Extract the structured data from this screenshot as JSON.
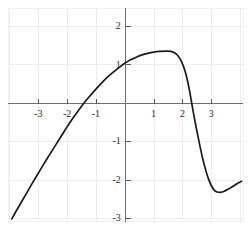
{
  "chart_data": {
    "type": "line",
    "title": "",
    "subtitle": "",
    "xlabel": "",
    "ylabel": "",
    "xlim": [
      -4.05,
      4.1
    ],
    "ylim": [
      -3.1,
      2.47
    ],
    "grid": true,
    "grid_spacing": {
      "x": 1,
      "y": 1
    },
    "legend": "none",
    "axis_origin": {
      "x": 0,
      "y": 0
    },
    "xticks": [
      -3,
      -2,
      -1,
      1,
      2,
      3
    ],
    "yticks": [
      2,
      1,
      -1,
      -2,
      -3
    ],
    "xtick_labels": [
      "-3",
      "-2",
      "-1",
      "1",
      "2",
      "3"
    ],
    "ytick_labels": [
      "2",
      "1",
      "-1",
      "-2",
      "-3"
    ],
    "series": [
      {
        "name": "curve",
        "color": "#1a1a1a",
        "points": [
          [
            -3.92,
            -3.02
          ],
          [
            -3.8,
            -2.86
          ],
          [
            -3.6,
            -2.6
          ],
          [
            -3.4,
            -2.34
          ],
          [
            -3.2,
            -2.08
          ],
          [
            -3.0,
            -1.83
          ],
          [
            -2.8,
            -1.58
          ],
          [
            -2.6,
            -1.34
          ],
          [
            -2.4,
            -1.1
          ],
          [
            -2.2,
            -0.86
          ],
          [
            -2.05,
            -0.68
          ],
          [
            -2.0,
            -0.62
          ],
          [
            -1.8,
            -0.4
          ],
          [
            -1.6,
            -0.19
          ],
          [
            -1.4,
            0.01
          ],
          [
            -1.2,
            0.19
          ],
          [
            -1.0,
            0.36
          ],
          [
            -0.8,
            0.52
          ],
          [
            -0.6,
            0.67
          ],
          [
            -0.4,
            0.8
          ],
          [
            -0.2,
            0.92
          ],
          [
            0.0,
            1.03
          ],
          [
            0.2,
            1.12
          ],
          [
            0.4,
            1.19
          ],
          [
            0.6,
            1.25
          ],
          [
            0.8,
            1.29
          ],
          [
            1.0,
            1.32
          ],
          [
            1.2,
            1.34
          ],
          [
            1.45,
            1.35
          ],
          [
            1.6,
            1.34
          ],
          [
            1.75,
            1.29
          ],
          [
            1.85,
            1.22
          ],
          [
            1.95,
            1.1
          ],
          [
            2.05,
            0.92
          ],
          [
            2.15,
            0.66
          ],
          [
            2.25,
            0.3
          ],
          [
            2.32,
            0.0
          ],
          [
            2.4,
            -0.34
          ],
          [
            2.5,
            -0.73
          ],
          [
            2.6,
            -1.1
          ],
          [
            2.7,
            -1.44
          ],
          [
            2.8,
            -1.73
          ],
          [
            2.9,
            -1.97
          ],
          [
            3.0,
            -2.15
          ],
          [
            3.1,
            -2.27
          ],
          [
            3.2,
            -2.32
          ],
          [
            3.32,
            -2.33
          ],
          [
            3.45,
            -2.3
          ],
          [
            3.6,
            -2.24
          ],
          [
            3.75,
            -2.17
          ],
          [
            3.92,
            -2.09
          ],
          [
            4.05,
            -2.04
          ]
        ]
      }
    ]
  },
  "axes": {
    "x_axis_name": "x-axis",
    "y_axis_name": "y-axis",
    "axis_color": "#6f6f6f",
    "grid_color": "#eceaea",
    "frame_color": "#f0eeee",
    "curve_color": "#1a1a1a"
  }
}
